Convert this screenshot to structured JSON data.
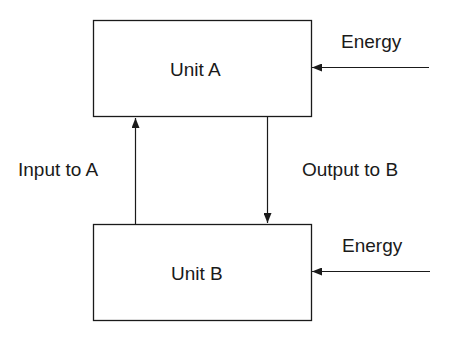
{
  "diagram": {
    "nodes": [
      {
        "id": "unit-a",
        "label": "Unit A"
      },
      {
        "id": "unit-b",
        "label": "Unit B"
      }
    ],
    "edges": [
      {
        "from": "unit-a",
        "to": "unit-b",
        "label": "Output to B"
      },
      {
        "from": "unit-b",
        "to": "unit-a",
        "label": "Input to A"
      },
      {
        "from": "external",
        "to": "unit-a",
        "label": "Energy"
      },
      {
        "from": "external",
        "to": "unit-b",
        "label": "Energy"
      }
    ],
    "colors": {
      "stroke": "#1a1a1a",
      "background": "#ffffff"
    }
  }
}
